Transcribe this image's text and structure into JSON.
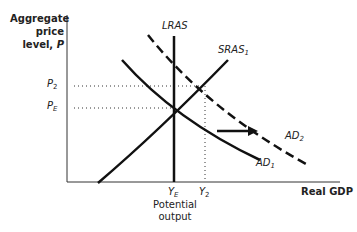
{
  "diagram": {
    "y_axis_label": {
      "line1": "Aggregate",
      "line2": "price",
      "line3": "level,",
      "var": "P"
    },
    "x_axis_label": "Real GDP",
    "price_ticks": [
      {
        "base": "P",
        "sub": "2"
      },
      {
        "base": "P",
        "sub": "E"
      }
    ],
    "output_ticks": [
      {
        "base": "Y",
        "sub": "E"
      },
      {
        "base": "Y",
        "sub": "2"
      }
    ],
    "potential_label": {
      "line1": "Potential",
      "line2": "output"
    },
    "curves": {
      "lras": {
        "label": "LRAS"
      },
      "sras1": {
        "base": "SRAS",
        "sub": "1"
      },
      "ad1": {
        "base": "AD",
        "sub": "1"
      },
      "ad2": {
        "base": "AD",
        "sub": "2"
      }
    },
    "annotation": "rightward shift of aggregate demand from AD1 to AD2",
    "colors": {
      "line": "#111111",
      "text": "#222222",
      "background": "#ffffff"
    }
  }
}
